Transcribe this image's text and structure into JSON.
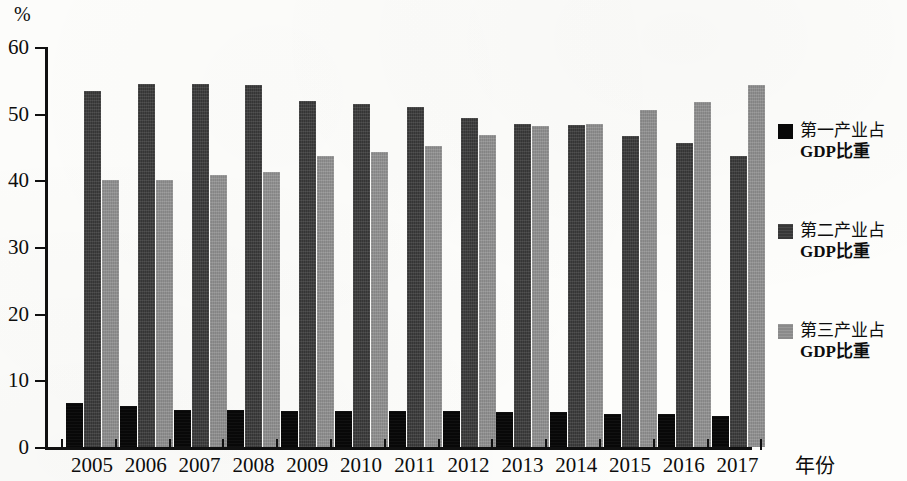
{
  "chart_data": {
    "type": "bar",
    "title": "",
    "xlabel": "年份",
    "ylabel": "%",
    "ylim": [
      0,
      60
    ],
    "ytick_values": [
      0,
      10,
      20,
      30,
      40,
      50,
      60
    ],
    "ytick_labels": [
      "0",
      "10",
      "20",
      "30",
      "40",
      "50",
      "60"
    ],
    "grid": false,
    "legend_position": "right",
    "categories": [
      "2005",
      "2006",
      "2007",
      "2008",
      "2009",
      "2010",
      "2011",
      "2012",
      "2013",
      "2014",
      "2015",
      "2016",
      "2017"
    ],
    "series": [
      {
        "name": "第一产业占GDP比重",
        "color": "#080808",
        "values": [
          6.6,
          6.1,
          5.6,
          5.5,
          5.4,
          5.4,
          5.4,
          5.4,
          5.3,
          5.2,
          5.0,
          5.0,
          4.6
        ]
      },
      {
        "name": "第二产业占GDP比重",
        "color": "#3a3a3a",
        "values": [
          53.4,
          54.4,
          54.4,
          54.3,
          51.9,
          51.5,
          51.0,
          49.4,
          48.4,
          48.3,
          46.6,
          45.6,
          43.7
        ]
      },
      {
        "name": "第三产业占GDP比重",
        "color": "#909090",
        "values": [
          40.0,
          40.1,
          40.8,
          41.2,
          43.7,
          44.2,
          45.1,
          46.8,
          48.2,
          48.4,
          50.5,
          51.7,
          54.3
        ]
      }
    ]
  },
  "axis": {
    "unit_label": "%",
    "x_axis_name": "年份"
  },
  "legend": {
    "items": [
      {
        "label_line1": "第一产业占",
        "label_line2": "GDP比重",
        "swatch": "s1"
      },
      {
        "label_line1": "第二产业占",
        "label_line2": "GDP比重",
        "swatch": "s2"
      },
      {
        "label_line1": "第三产业占",
        "label_line2": "GDP比重",
        "swatch": "s3"
      }
    ]
  }
}
